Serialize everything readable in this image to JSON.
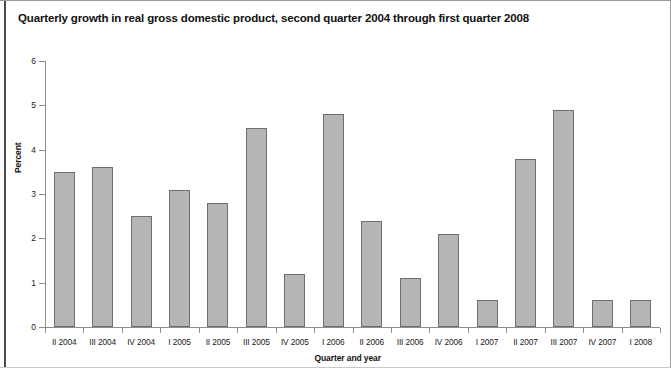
{
  "chart_data": {
    "type": "bar",
    "title": "Quarterly growth in real gross domestic product, second quarter 2004 through first quarter 2008",
    "xlabel": "Quarter and year",
    "ylabel": "Percent",
    "categories": [
      "II 2004",
      "III 2004",
      "IV 2004",
      "I 2005",
      "II 2005",
      "III 2005",
      "IV 2005",
      "I 2006",
      "II 2006",
      "III 2006",
      "IV 2006",
      "I 2007",
      "II 2007",
      "III 2007",
      "IV 2007",
      "I 2008"
    ],
    "values": [
      3.5,
      3.6,
      2.5,
      3.1,
      2.8,
      4.5,
      1.2,
      4.8,
      2.4,
      1.1,
      2.1,
      0.6,
      3.8,
      4.9,
      0.6,
      0.6
    ],
    "ylim": [
      0,
      6
    ],
    "yticks": [
      0,
      1,
      2,
      3,
      4,
      5,
      6
    ],
    "ytick_labels": [
      "0",
      "1",
      "2",
      "3",
      "4",
      "5",
      "6"
    ],
    "grid": false,
    "legend": null,
    "bar_color": "#b5b5b5",
    "bar_edge_color": "#6f6f6f",
    "axis_color": "#8d8d8d",
    "text_color": "#1a1a1a"
  }
}
